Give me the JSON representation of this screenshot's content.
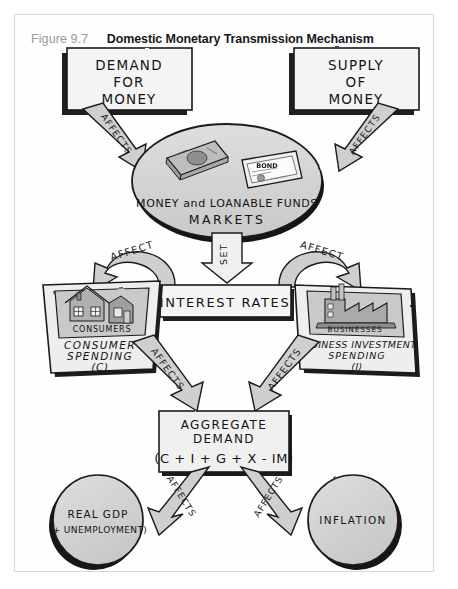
{
  "figure": {
    "number": "Figure 9.7",
    "title": "Domestic Monetary Transmission Mechanism"
  },
  "nodes": {
    "demand_for_money": {
      "line1": "DEMAND",
      "line2": "FOR",
      "line3": "MONEY"
    },
    "supply_of_money": {
      "line1": "SUPPLY",
      "line2": "OF",
      "line3": "MONEY"
    },
    "money_market": {
      "line1": "MONEY and LOANABLE FUNDS",
      "line2": "MARKETS",
      "bond_label": "BOND"
    },
    "interest_rates": {
      "label": "INTEREST RATES"
    },
    "consumer_spending": {
      "image_label": "CONSUMERS",
      "line1": "CONSUMER",
      "line2": "SPENDING",
      "line3": "(C)"
    },
    "business_investment": {
      "image_label": "BUSINESSES",
      "line1": "BUSINESS INVESTMENT",
      "line2": "SPENDING",
      "line3": "(I)"
    },
    "aggregate_demand": {
      "line1": "AGGREGATE",
      "line2": "DEMAND",
      "line3": "(C + I + G + X - IM)"
    },
    "real_gdp": {
      "line1": "REAL GDP",
      "line2": "(+ UNEMPLOYMENT)"
    },
    "inflation": {
      "label": "INFLATION"
    }
  },
  "arrows": {
    "demand_to_market": "AFFECTS",
    "supply_to_market": "AFFECTS",
    "market_to_rates": "SET",
    "rates_to_consumer": "AFFECT",
    "rates_to_business": "AFFECT",
    "consumer_to_ad": "AFFECTS",
    "business_to_ad": "AFFECTS",
    "ad_to_gdp": "AFFECTS",
    "ad_to_inflation": "AFFECTS"
  },
  "colors": {
    "ink": "#1a1a1a",
    "arrow_fill": "#cfcfcf",
    "box_fill": "#f2f2f2",
    "shape_fill": "#d6d6d6",
    "frame": "#d8d8d8",
    "fig_number": "#9a9a9a"
  }
}
